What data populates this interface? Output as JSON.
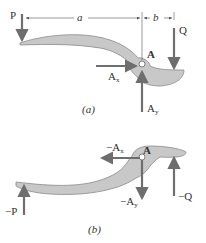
{
  "figure_a": {
    "caption": "(a)",
    "labels": {
      "P": "P",
      "a": "a",
      "b": "b",
      "Q": "Q",
      "A": "A",
      "Ax": "A",
      "Ax_sub": "x",
      "Ay": "A",
      "Ay_sub": "y"
    }
  },
  "figure_b": {
    "caption": "(b)",
    "labels": {
      "negP": "−P",
      "negQ": "−Q",
      "A": "A",
      "negAx": "−A",
      "negAx_sub": "x",
      "negAy": "−A",
      "negAy_sub": "y"
    }
  },
  "colors": {
    "body_fill": "#c8c8c8",
    "body_stroke": "#8a8a8a",
    "arrow": "#6e6e6e",
    "dimension_line": "#555555",
    "text": "#333333"
  }
}
